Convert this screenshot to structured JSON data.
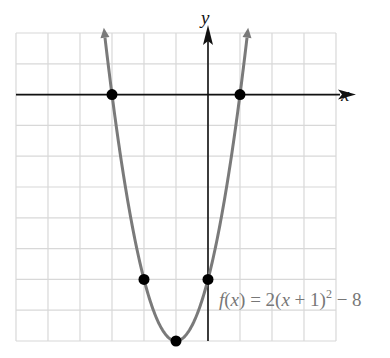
{
  "chart_data": {
    "type": "line",
    "title": "",
    "function_label": "f(x) = 2(x + 1)^2 − 8",
    "function_label_parts": {
      "lhs": "f",
      "arg": "x",
      "eq": " = 2(",
      "var": "x",
      "mid": " + 1)",
      "exp": "2",
      "tail": " − 8"
    },
    "xlabel": "x",
    "ylabel": "y",
    "xlim": [
      -6,
      4
    ],
    "ylim": [
      -8,
      2
    ],
    "grid": true,
    "grid_step": 1,
    "curve": {
      "a": 2,
      "h": -1,
      "k": -8,
      "color": "#7a7a7a"
    },
    "points": [
      {
        "x": -3,
        "y": 0,
        "label": "x-intercept"
      },
      {
        "x": 1,
        "y": 0,
        "label": "x-intercept"
      },
      {
        "x": -2,
        "y": -6,
        "label": "point"
      },
      {
        "x": 0,
        "y": -6,
        "label": "y-intercept"
      },
      {
        "x": -1,
        "y": -8,
        "label": "vertex"
      }
    ],
    "colors": {
      "grid": "#d8d8d8",
      "axis": "#111111",
      "curve": "#7a7a7a",
      "point": "#000000",
      "label": "#777777"
    }
  }
}
